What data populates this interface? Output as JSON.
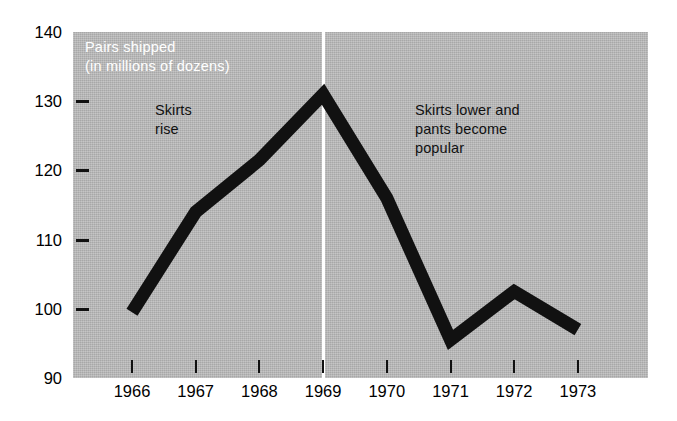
{
  "chart_data": {
    "type": "line",
    "title": "Pairs shipped\n(in millions of dozens)",
    "xlabel": "",
    "ylabel": "Pairs shipped (in millions of dozens)",
    "x": [
      "1966",
      "1967",
      "1968",
      "1969",
      "1970",
      "1971",
      "1972",
      "1973"
    ],
    "categories": [
      "1966",
      "1967",
      "1968",
      "1969",
      "1970",
      "1971",
      "1972",
      "1973"
    ],
    "values": [
      99.5,
      114,
      121.5,
      131,
      116,
      95.5,
      102.5,
      97
    ],
    "series": [
      {
        "name": "Pairs shipped",
        "values": [
          99.5,
          114,
          121.5,
          131,
          116,
          95.5,
          102.5,
          97
        ]
      }
    ],
    "ylim": [
      90,
      140
    ],
    "ytick_labels": [
      "140",
      "130",
      "120",
      "110",
      "100",
      "90"
    ],
    "ytick_values": [
      140,
      130,
      120,
      110,
      100,
      90
    ],
    "ytick_marks": [
      130,
      120,
      110,
      100
    ],
    "xtick_labels": [
      "1966",
      "1967",
      "1968",
      "1969",
      "1970",
      "1971",
      "1972",
      "1973"
    ],
    "grid": false,
    "legend": null,
    "annotations": [
      {
        "text": "Skirts\nrise",
        "at_x": "1967",
        "position": "left-of-divider"
      },
      {
        "text": "Skirts lower and\npants become\npopular",
        "at_x": "1970",
        "position": "right-of-divider"
      }
    ],
    "divider": {
      "at_x": "1969",
      "color": "#ffffff",
      "label": ""
    },
    "colors": {
      "panel_background": "#b9b9b9",
      "line": "#111111",
      "caption_text": "#ffffff",
      "annotation_text": "#111111",
      "axis_text": "#000000",
      "page_background": "#ffffff"
    },
    "line_width_px": 13
  },
  "axis": {
    "y_labels": [
      {
        "value": 140,
        "text": "140"
      },
      {
        "value": 130,
        "text": "130"
      },
      {
        "value": 120,
        "text": "120"
      },
      {
        "value": 110,
        "text": "110"
      },
      {
        "value": 100,
        "text": "100"
      },
      {
        "value": 90,
        "text": "90"
      }
    ],
    "x_labels": [
      {
        "value": "1966",
        "text": "1966"
      },
      {
        "value": "1967",
        "text": "1967"
      },
      {
        "value": "1968",
        "text": "1968"
      },
      {
        "value": "1969",
        "text": "1969"
      },
      {
        "value": "1970",
        "text": "1970"
      },
      {
        "value": "1971",
        "text": "1971"
      },
      {
        "value": "1972",
        "text": "1972"
      },
      {
        "value": "1973",
        "text": "1973"
      }
    ]
  },
  "panel": {
    "caption_line1": "Pairs shipped",
    "caption_line2": "(in millions of dozens)"
  },
  "annotations": {
    "left_line1": "Skirts",
    "left_line2": "rise",
    "right_line1": "Skirts lower and",
    "right_line2": "pants become",
    "right_line3": "popular"
  }
}
